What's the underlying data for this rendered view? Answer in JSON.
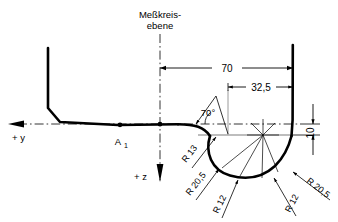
{
  "drawing": {
    "title_line1": "Meßkreis-",
    "title_line2": "ebene",
    "axes": {
      "y_label": "+ y",
      "z_label": "+ z"
    },
    "points": {
      "a1_label": "A",
      "a1_subscript": "1"
    },
    "dimensions": [
      {
        "name": "overall-width",
        "value": "70",
        "orientation": "horizontal"
      },
      {
        "name": "inner-width",
        "value": "32,5",
        "orientation": "horizontal"
      },
      {
        "name": "flange-height",
        "value": "10",
        "orientation": "vertical"
      }
    ],
    "angle": {
      "name": "flank-angle",
      "value": "70°"
    },
    "radii": [
      {
        "name": "radius-r13",
        "label": "R 13"
      },
      {
        "name": "radius-r205-left",
        "label": "R 20,5"
      },
      {
        "name": "radius-r12-left",
        "label": "R 12"
      },
      {
        "name": "radius-r12-right",
        "label": "R 12"
      },
      {
        "name": "radius-r205-right",
        "label": "R 20,5"
      }
    ],
    "colors": {
      "profile": "#000000",
      "construction": "#7d7d7d",
      "background": "#ffffff"
    }
  }
}
